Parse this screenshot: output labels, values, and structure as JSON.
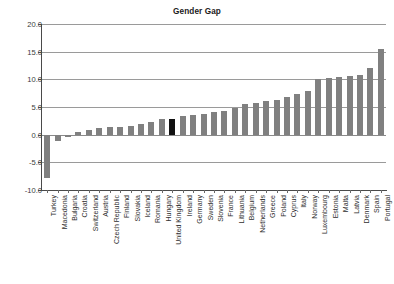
{
  "chart": {
    "title": "Gender Gap",
    "xlabel": "",
    "ylabel": ""
  },
  "chart_data": {
    "type": "bar",
    "title": "Gender Gap",
    "xlabel": "",
    "ylabel": "",
    "ylim": [
      -10.0,
      20.0
    ],
    "yticks": [
      20.0,
      15.0,
      10.0,
      5.0,
      0.0,
      -5.0,
      -10.0
    ],
    "ytick_labels": [
      "20.0",
      "15.0",
      "10.0",
      "5.0",
      "0.0",
      "-5.0",
      "-10.0"
    ],
    "grid": true,
    "legend": false,
    "bar_color": "#808080",
    "highlight_color": "#111111",
    "highlight_category": "United Kingdom",
    "categories": [
      "Turkey",
      "Macedonia",
      "Bulgaria",
      "Croatia",
      "Switzerland",
      "Austria",
      "Czech Republic",
      "Finland",
      "Slovakia",
      "Iceland",
      "Romania",
      "Hungary",
      "United Kingdom",
      "Ireland",
      "Germany",
      "Sweden",
      "Slovenia",
      "France",
      "Lithuania",
      "Belgium",
      "Netherlands",
      "Greece",
      "Poland",
      "Cyprus",
      "Italy",
      "Norway",
      "Luxembourg",
      "Estonia",
      "Malta",
      "Latvia",
      "Denmark",
      "Spain",
      "Portugal"
    ],
    "values": [
      -7.9,
      -1.2,
      -0.5,
      0.5,
      0.9,
      1.2,
      1.3,
      1.4,
      1.6,
      1.9,
      2.3,
      2.8,
      2.9,
      3.4,
      3.6,
      3.7,
      4.1,
      4.3,
      4.8,
      5.6,
      5.8,
      6.0,
      6.3,
      6.8,
      7.4,
      7.9,
      10.0,
      10.3,
      10.5,
      10.6,
      10.8,
      12.0,
      15.5
    ]
  }
}
